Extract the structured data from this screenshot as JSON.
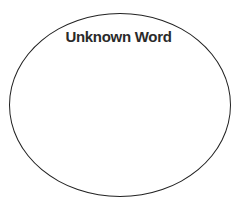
{
  "diagram": {
    "shape": "ellipse",
    "title": "Unknown Word",
    "stroke_color": "#222222",
    "text_color": "#2a2a2a"
  }
}
